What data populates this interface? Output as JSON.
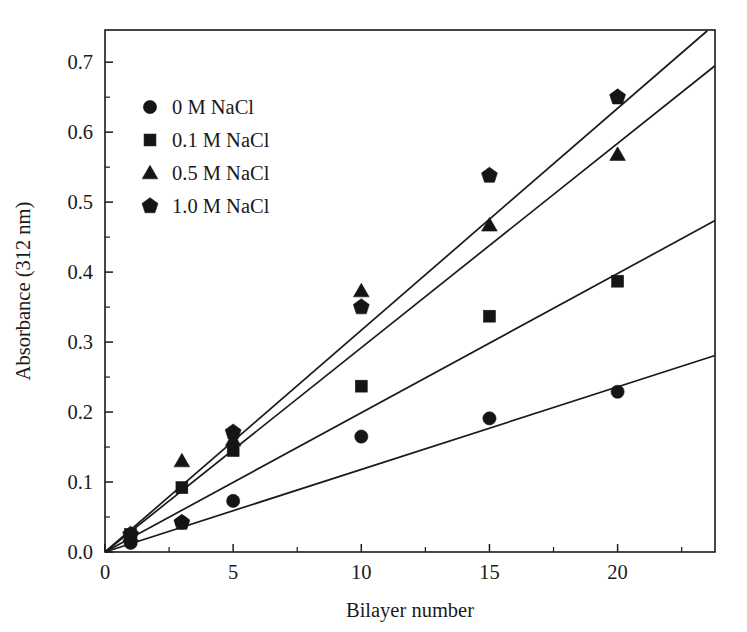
{
  "chart_data": {
    "type": "scatter",
    "title": "",
    "xlabel": "Bilayer number",
    "ylabel": "Absorbance (312 nm)",
    "xlim": [
      0,
      23.8
    ],
    "ylim": [
      0.0,
      0.746
    ],
    "grid": false,
    "legend_position": "upper-left",
    "x_ticks": [
      0,
      5,
      10,
      15,
      20
    ],
    "x_tick_labels": [
      "0",
      "5",
      "10",
      "15",
      "20"
    ],
    "x_minor_ticks": [
      2.5,
      7.5,
      12.5,
      17.5,
      22.5
    ],
    "y_ticks": [
      0.0,
      0.1,
      0.2,
      0.3,
      0.4,
      0.5,
      0.6,
      0.7
    ],
    "y_tick_labels": [
      "0.0",
      "0.1",
      "0.2",
      "0.3",
      "0.4",
      "0.5",
      "0.6",
      "0.7"
    ],
    "y_minor_ticks": [
      0.05,
      0.15,
      0.25,
      0.35,
      0.45,
      0.55,
      0.65
    ],
    "series": [
      {
        "name": "0 M NaCl",
        "marker": "circle",
        "color": "#151515",
        "x": [
          1,
          3,
          5,
          10,
          15,
          20
        ],
        "values": [
          0.013,
          0.042,
          0.073,
          0.165,
          0.191,
          0.229
        ],
        "fit_slope": 0.0118,
        "fit_intercept": 0.0,
        "fit_x_end": 23.8
      },
      {
        "name": "0.1 M NaCl",
        "marker": "square",
        "color": "#151515",
        "x": [
          1,
          3,
          5,
          10,
          15,
          20
        ],
        "values": [
          0.025,
          0.092,
          0.145,
          0.237,
          0.337,
          0.387
        ],
        "fit_slope": 0.0199,
        "fit_intercept": 0.0,
        "fit_x_end": 23.8
      },
      {
        "name": "0.5 M NaCl",
        "marker": "triangle",
        "color": "#151515",
        "x": [
          1,
          3,
          5,
          10,
          15,
          20
        ],
        "values": [
          0.024,
          0.13,
          0.16,
          0.373,
          0.467,
          0.568
        ],
        "fit_slope": 0.0292,
        "fit_intercept": 0.0,
        "fit_x_end": 23.8
      },
      {
        "name": "1.0 M NaCl",
        "marker": "pentagon",
        "color": "#151515",
        "x": [
          1,
          3,
          5,
          10,
          15,
          20
        ],
        "values": [
          0.025,
          0.042,
          0.171,
          0.35,
          0.538,
          0.65
        ],
        "fit_slope": 0.0317,
        "fit_intercept": 0.0,
        "fit_x_end": 23.5
      }
    ]
  },
  "legend": {
    "entries": [
      {
        "label": "0 M NaCl",
        "marker": "circle-marker"
      },
      {
        "label": "0.1 M NaCl",
        "marker": "square-marker"
      },
      {
        "label": "0.5 M NaCl",
        "marker": "triangle-marker"
      },
      {
        "label": "1.0 M NaCl",
        "marker": "pentagon-marker"
      }
    ]
  }
}
